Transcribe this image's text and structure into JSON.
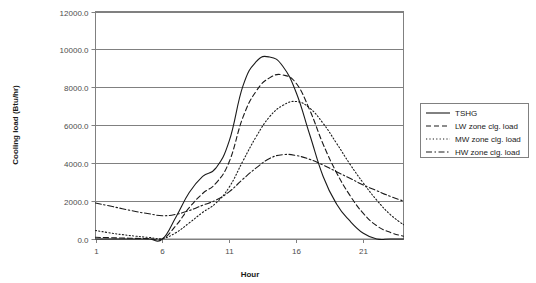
{
  "chart_data": {
    "type": "line",
    "title": "",
    "xlabel": "Hour",
    "ylabel": "Cooling load (Btu/hr)",
    "xlim": [
      1,
      24
    ],
    "ylim": [
      0,
      12000
    ],
    "grid": true,
    "legend_position": "right",
    "x": [
      1,
      2,
      3,
      4,
      5,
      6,
      7,
      8,
      9,
      10,
      11,
      12,
      13,
      14,
      15,
      16,
      17,
      18,
      19,
      20,
      21,
      22,
      23,
      24
    ],
    "xticks": [
      "1",
      "6",
      "11",
      "16",
      "21"
    ],
    "xtick_values": [
      1,
      6,
      11,
      16,
      21
    ],
    "yticks": [
      "0.0",
      "2000.0",
      "4000.0",
      "6000.0",
      "8000.0",
      "10000.0",
      "12000.0"
    ],
    "ytick_values": [
      0,
      2000,
      4000,
      6000,
      8000,
      10000,
      12000
    ],
    "series": [
      {
        "name": "TSHG",
        "style": "solid",
        "color": "#1a1a1a",
        "values": [
          0,
          0,
          0,
          0,
          0,
          0,
          1150,
          2450,
          3300,
          3750,
          5200,
          8050,
          9350,
          9600,
          9100,
          7700,
          5500,
          3300,
          1850,
          950,
          300,
          0,
          0,
          0
        ]
      },
      {
        "name": "LW zone clg. load",
        "style": "dashed",
        "color": "#1a1a1a",
        "values": [
          90,
          70,
          50,
          35,
          20,
          10,
          700,
          1650,
          2400,
          2950,
          4100,
          6400,
          7800,
          8500,
          8650,
          8200,
          6800,
          5000,
          3500,
          2300,
          1350,
          700,
          350,
          150
        ]
      },
      {
        "name": "MW zone clg. load",
        "style": "dotted",
        "color": "#1a1a1a",
        "values": [
          450,
          330,
          230,
          150,
          80,
          30,
          330,
          850,
          1400,
          1900,
          2750,
          4100,
          5400,
          6450,
          7050,
          7250,
          6900,
          6100,
          5050,
          3950,
          2950,
          2050,
          1300,
          750
        ]
      },
      {
        "name": "HW zone clg. load",
        "style": "dashdot",
        "color": "#1a1a1a",
        "values": [
          1900,
          1750,
          1600,
          1450,
          1330,
          1230,
          1300,
          1500,
          1780,
          2050,
          2500,
          3150,
          3750,
          4250,
          4450,
          4400,
          4200,
          3900,
          3550,
          3200,
          2850,
          2550,
          2250,
          2000
        ]
      }
    ]
  },
  "legend": {
    "entries": [
      {
        "label": "TSHG",
        "style": "solid"
      },
      {
        "label": "LW zone clg. load",
        "style": "dashed"
      },
      {
        "label": "MW zone clg. load",
        "style": "dotted"
      },
      {
        "label": "HW zone clg. load",
        "style": "dashdot"
      }
    ]
  },
  "colors": {
    "line": "#1a1a1a",
    "grid": "#808080",
    "frame": "#808080",
    "text": "#1a1a1a",
    "tick_text": "#4d4d4d",
    "background": "#ffffff"
  }
}
